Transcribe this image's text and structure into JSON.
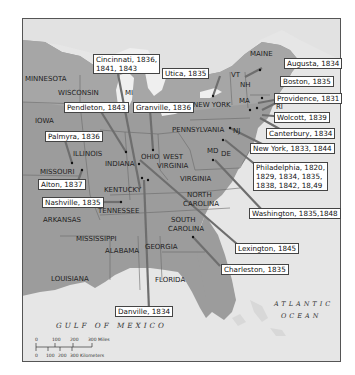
{
  "map": {
    "colors": {
      "ocean": "#e4e4e4",
      "land": "#9a9a9a",
      "land_north": "#b5b5b5",
      "lake": "#f2f2f2",
      "border": "#6a6a6a",
      "leader": "#6e6e6e"
    },
    "states": {
      "minnesota": "MINNESOTA",
      "wisconsin": "WISCONSIN",
      "mi": "MI",
      "iowa": "IOWA",
      "illinois": "ILLINOIS",
      "indiana": "INDIANA",
      "ohio": "OHIO",
      "missouri": "MISSOURI",
      "kentucky": "KENTUCKY",
      "tennessee": "TENNESSEE",
      "arkansas": "ARKANSAS",
      "mississippi": "MISSISSIPPI",
      "alabama": "ALABAMA",
      "georgia": "GEORGIA",
      "louisiana": "LOUISIANA",
      "florida": "FLORIDA",
      "west_virginia_1": "WEST",
      "west_virginia_2": "VIRGINIA",
      "virginia": "VIRGINIA",
      "north_carolina_1": "NORTH",
      "north_carolina_2": "CAROLINA",
      "south_carolina_1": "SOUTH",
      "south_carolina_2": "CAROLINA",
      "pennsylvania": "PENNSYLVANIA",
      "new_york": "NEW YORK",
      "nj": "NJ",
      "md": "MD",
      "de": "DE",
      "vt": "VT",
      "nh": "NH",
      "ma": "MA",
      "ri": "RI",
      "maine": "MAINE"
    },
    "callouts": {
      "cincinnati": "Cincinnati, 1836,\n1841, 1843",
      "utica": "Utica, 1835",
      "pendleton": "Pendleton, 1843",
      "granville": "Granville, 1836",
      "palmyra": "Palmyra, 1836",
      "alton": "Alton, 1837",
      "nashville": "Nashville, 1835",
      "augusta": "Augusta, 1834",
      "boston": "Boston, 1835",
      "providence": "Providence, 1831",
      "wolcott": "Wolcott, 1839",
      "canterbury": "Canterbury, 1834",
      "new_york": "New York, 1833, 1844",
      "philadelphia": "Philadelphia, 1820,\n1829, 1834, 1835,\n1838, 1842, 18,49",
      "washington": "Washington, 1835,1848",
      "lexington": "Lexington, 1845",
      "charleston": "Charleston, 1835",
      "danville": "Danville, 1834"
    },
    "water": {
      "gulf": "GULF OF MEXICO",
      "atlantic_1": "ATLANTIC",
      "atlantic_2": "OCEAN"
    },
    "scale": {
      "miles": [
        "0",
        "100",
        "200",
        "300 Miles"
      ],
      "kilometers": [
        "0",
        "100",
        "200",
        "300 Kilometers"
      ]
    }
  }
}
